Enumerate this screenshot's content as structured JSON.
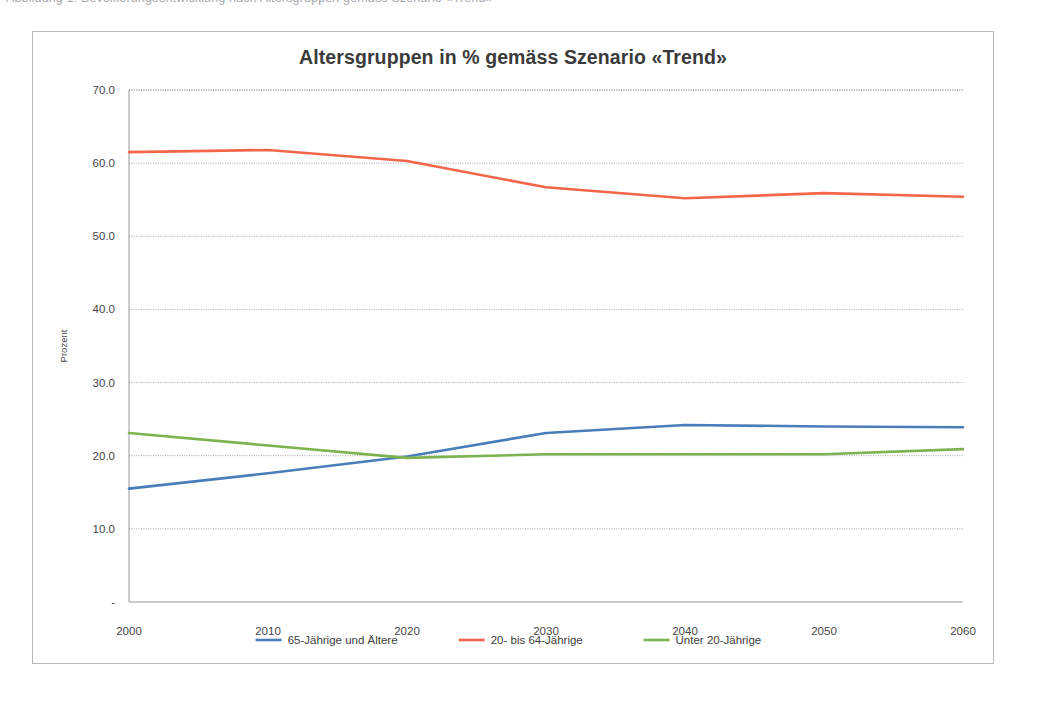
{
  "page": {
    "scan_top_text_fragment": "Abbildung 1:  Bevölkerungsentwicklung nach Altersgruppen gemäss Szenario «Trend»"
  },
  "chart_data": {
    "type": "line",
    "title": "Altersgruppen in % gemäss Szenario «Trend»",
    "xlabel": "",
    "ylabel": "Prozent",
    "x": [
      2000,
      2010,
      2020,
      2030,
      2040,
      2050,
      2060
    ],
    "categories": [
      "2000",
      "2010",
      "2020",
      "2030",
      "2040",
      "2050",
      "2060"
    ],
    "xlim": [
      2000,
      2060
    ],
    "ylim": [
      0,
      70
    ],
    "ytick_labels": [
      "70.0",
      "60.0",
      "50.0",
      "40.0",
      "30.0",
      "20.0",
      "10.0",
      "-"
    ],
    "ytick_values": [
      70,
      60,
      50,
      40,
      30,
      20,
      10,
      0
    ],
    "grid": "horizontal-dotted",
    "legend_position": "bottom",
    "series": [
      {
        "name": "65-Jährige und Ältere",
        "color": "#4a7ebb",
        "values": [
          15.5,
          17.6,
          19.9,
          23.1,
          24.2,
          24.0,
          23.9
        ]
      },
      {
        "name": "20- bis 64-Jährige",
        "color": "#f4664a",
        "values": [
          61.5,
          61.8,
          60.3,
          56.7,
          55.2,
          55.9,
          55.4
        ]
      },
      {
        "name": "Unter 20-Jährige",
        "color": "#7cb350",
        "values": [
          23.1,
          21.4,
          19.7,
          20.2,
          20.2,
          20.2,
          20.9
        ]
      }
    ]
  }
}
